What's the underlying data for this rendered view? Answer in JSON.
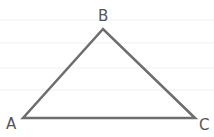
{
  "diagram": {
    "type": "triangle",
    "vertices": [
      {
        "label": "A",
        "x": 23,
        "y": 118
      },
      {
        "label": "B",
        "x": 103,
        "y": 29
      },
      {
        "label": "C",
        "x": 195,
        "y": 118
      }
    ],
    "edge_color": "#6e6e6e",
    "background_rules": [
      20,
      43,
      68,
      90
    ]
  }
}
